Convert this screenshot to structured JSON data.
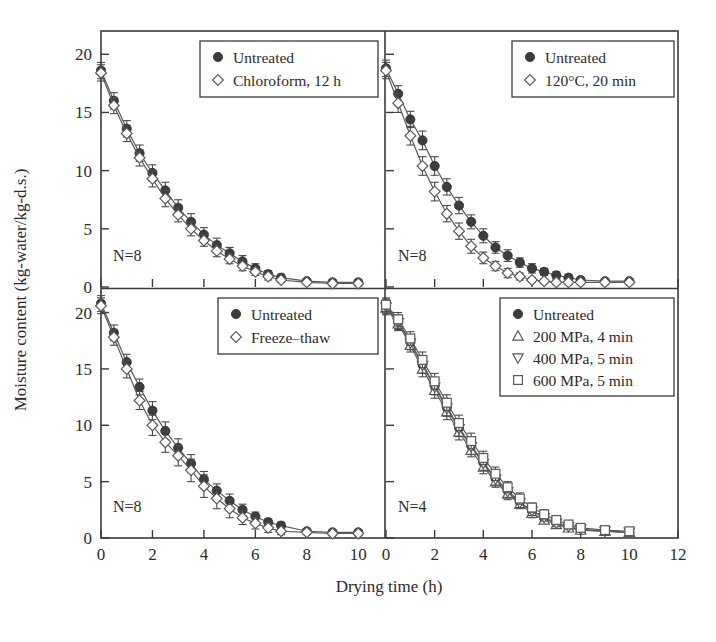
{
  "figure": {
    "xlabel": "Drying time (h)",
    "ylabel": "Moisture content (kg-water/kg-d.s.)",
    "x_ticks": [
      0,
      2,
      4,
      6,
      8,
      10,
      12
    ],
    "y_ticks": [
      0,
      5,
      10,
      15,
      20
    ],
    "xlim": [
      0,
      12
    ],
    "ylim": [
      0,
      22
    ],
    "panel_xlim_left": [
      0,
      11
    ],
    "marker_colors": {
      "filled_circle": "#3d3d3d",
      "open_marker_fill": "#ffffff",
      "line": "#5a5a5a",
      "axis": "#3a3a3a"
    }
  },
  "chart_data": {
    "type": "line",
    "title": "",
    "xlabel": "Drying time (h)",
    "ylabel": "Moisture content (kg-water/kg-d.s.)",
    "xlim": [
      0,
      12
    ],
    "ylim": [
      0,
      22
    ],
    "xticks": [
      0,
      2,
      4,
      6,
      8,
      10,
      12
    ],
    "yticks": [
      0,
      5,
      10,
      15,
      20
    ],
    "grid": false,
    "legend_position": "top-right inside each panel",
    "panels": [
      {
        "panel_id": "top-left",
        "n_label": "N=8",
        "legend": [
          {
            "label": "Untreated",
            "marker": "filled-circle"
          },
          {
            "label": "Chloroform, 12 h",
            "marker": "open-diamond"
          }
        ],
        "x": [
          0,
          0.5,
          1,
          1.5,
          2,
          2.5,
          3,
          3.5,
          4,
          4.5,
          5,
          5.5,
          6,
          6.5,
          7,
          8,
          9,
          10
        ],
        "series": [
          {
            "name": "Untreated",
            "marker": "filled-circle",
            "values": [
              18.6,
              16.0,
              13.6,
              11.5,
              9.8,
              8.3,
              6.8,
              5.6,
              4.5,
              3.6,
              2.9,
              2.2,
              1.6,
              1.1,
              0.8,
              0.5,
              0.4,
              0.4
            ],
            "errors": [
              0.7,
              0.7,
              0.7,
              0.7,
              0.7,
              0.7,
              0.7,
              0.7,
              0.6,
              0.6,
              0.5,
              0.5,
              0.4,
              0.3,
              0.3,
              0.2,
              0.2,
              0.2
            ]
          },
          {
            "name": "Chloroform, 12 h",
            "marker": "open-diamond",
            "values": [
              18.4,
              15.6,
              13.2,
              11.1,
              9.3,
              7.6,
              6.2,
              5.0,
              4.0,
              3.1,
              2.4,
              1.8,
              1.3,
              0.9,
              0.6,
              0.4,
              0.3,
              0.3
            ],
            "errors": [
              0.7,
              0.7,
              0.7,
              0.7,
              0.7,
              0.7,
              0.6,
              0.6,
              0.5,
              0.5,
              0.4,
              0.4,
              0.3,
              0.3,
              0.2,
              0.2,
              0.2,
              0.2
            ]
          }
        ]
      },
      {
        "panel_id": "top-right",
        "n_label": "N=8",
        "legend": [
          {
            "label": "Untreated",
            "marker": "filled-circle"
          },
          {
            "label": "120°C, 20 min",
            "marker": "open-diamond"
          }
        ],
        "x": [
          0,
          0.5,
          1,
          1.5,
          2,
          2.5,
          3,
          3.5,
          4,
          4.5,
          5,
          5.5,
          6,
          6.5,
          7,
          7.5,
          8,
          9,
          10
        ],
        "series": [
          {
            "name": "Untreated",
            "marker": "filled-circle",
            "values": [
              18.8,
              16.6,
              14.4,
              12.6,
              10.4,
              8.6,
              7.0,
              5.6,
              4.4,
              3.4,
              2.7,
              2.1,
              1.6,
              1.3,
              1.0,
              0.8,
              0.6,
              0.5,
              0.5
            ],
            "errors": [
              0.7,
              0.7,
              0.7,
              0.8,
              0.8,
              0.7,
              0.7,
              0.6,
              0.6,
              0.5,
              0.5,
              0.4,
              0.4,
              0.3,
              0.3,
              0.3,
              0.2,
              0.2,
              0.2
            ]
          },
          {
            "name": "120°C, 20 min",
            "marker": "open-diamond",
            "values": [
              18.6,
              15.8,
              13.0,
              10.4,
              8.2,
              6.3,
              4.8,
              3.5,
              2.5,
              1.8,
              1.2,
              0.9,
              0.6,
              0.5,
              0.4,
              0.4,
              0.4,
              0.4,
              0.4
            ],
            "errors": [
              0.7,
              0.8,
              0.8,
              0.8,
              0.8,
              0.7,
              0.7,
              0.6,
              0.5,
              0.4,
              0.4,
              0.3,
              0.2,
              0.2,
              0.2,
              0.2,
              0.2,
              0.2,
              0.2
            ]
          }
        ]
      },
      {
        "panel_id": "bottom-left",
        "n_label": "N=8",
        "legend": [
          {
            "label": "Untreated",
            "marker": "filled-circle"
          },
          {
            "label": "Freeze–thaw",
            "marker": "open-diamond"
          }
        ],
        "x": [
          0,
          0.5,
          1,
          1.5,
          2,
          2.5,
          3,
          3.5,
          4,
          4.5,
          5,
          5.5,
          6,
          6.5,
          7,
          8,
          9,
          10
        ],
        "series": [
          {
            "name": "Untreated",
            "marker": "filled-circle",
            "values": [
              20.8,
              18.2,
              15.6,
              13.4,
              11.3,
              9.5,
              8.0,
              6.6,
              5.2,
              4.2,
              3.3,
              2.5,
              1.9,
              1.4,
              1.1,
              0.6,
              0.5,
              0.5
            ],
            "errors": [
              0.7,
              0.7,
              0.7,
              0.7,
              0.8,
              0.8,
              0.8,
              0.8,
              0.7,
              0.6,
              0.6,
              0.5,
              0.4,
              0.3,
              0.3,
              0.2,
              0.2,
              0.2
            ]
          },
          {
            "name": "Freeze–thaw",
            "marker": "open-diamond",
            "values": [
              20.6,
              17.8,
              15.0,
              12.2,
              10.0,
              8.5,
              7.3,
              6.0,
              4.6,
              3.5,
              2.6,
              1.8,
              1.3,
              0.9,
              0.6,
              0.5,
              0.4,
              0.4
            ],
            "errors": [
              0.7,
              0.7,
              0.8,
              0.8,
              0.9,
              0.9,
              0.9,
              1.0,
              1.0,
              0.9,
              0.8,
              0.6,
              0.5,
              0.4,
              0.3,
              0.2,
              0.2,
              0.2
            ]
          }
        ]
      },
      {
        "panel_id": "bottom-right",
        "n_label": "N=4",
        "legend": [
          {
            "label": "Untreated",
            "marker": "filled-circle"
          },
          {
            "label": "200 MPa, 4 min",
            "marker": "open-triangle-up"
          },
          {
            "label": "400 MPa, 5 min",
            "marker": "open-triangle-down"
          },
          {
            "label": "600 MPa, 5 min",
            "marker": "open-square"
          }
        ],
        "x": [
          0,
          0.5,
          1,
          1.5,
          2,
          2.5,
          3,
          3.5,
          4,
          4.5,
          5,
          5.5,
          6,
          6.5,
          7,
          7.5,
          8,
          9,
          10
        ],
        "series": [
          {
            "name": "Untreated",
            "marker": "filled-circle",
            "values": [
              20.6,
              19.2,
              17.4,
              15.4,
              13.5,
              11.6,
              9.8,
              8.2,
              6.7,
              5.3,
              4.2,
              3.2,
              2.4,
              1.8,
              1.3,
              1.0,
              0.7,
              0.6,
              0.5
            ],
            "errors": [
              0.6,
              0.6,
              0.6,
              0.7,
              0.7,
              0.7,
              0.7,
              0.7,
              0.6,
              0.6,
              0.5,
              0.5,
              0.4,
              0.3,
              0.3,
              0.2,
              0.2,
              0.2,
              0.2
            ]
          },
          {
            "name": "200 MPa, 4 min",
            "marker": "open-triangle-up",
            "values": [
              20.4,
              19.0,
              17.1,
              15.0,
              13.1,
              11.2,
              9.4,
              7.8,
              6.3,
              5.0,
              3.9,
              3.0,
              2.2,
              1.6,
              1.2,
              0.9,
              0.7,
              0.6,
              0.5
            ],
            "errors": [
              0.6,
              0.6,
              0.6,
              0.7,
              0.7,
              0.7,
              0.7,
              0.6,
              0.6,
              0.5,
              0.5,
              0.4,
              0.4,
              0.3,
              0.3,
              0.2,
              0.2,
              0.2,
              0.2
            ]
          },
          {
            "name": "400 MPa, 5 min",
            "marker": "open-triangle-down",
            "values": [
              20.5,
              19.1,
              17.3,
              15.3,
              13.4,
              11.5,
              9.7,
              8.1,
              6.6,
              5.2,
              4.1,
              3.1,
              2.4,
              1.8,
              1.3,
              1.0,
              0.8,
              0.6,
              0.5
            ],
            "errors": [
              0.6,
              0.6,
              0.6,
              0.7,
              0.7,
              0.7,
              0.7,
              0.7,
              0.6,
              0.5,
              0.5,
              0.4,
              0.4,
              0.3,
              0.3,
              0.2,
              0.2,
              0.2,
              0.2
            ]
          },
          {
            "name": "600 MPa, 5 min",
            "marker": "open-square",
            "values": [
              20.7,
              19.4,
              17.7,
              15.8,
              13.9,
              12.0,
              10.2,
              8.6,
              7.1,
              5.7,
              4.5,
              3.5,
              2.7,
              2.1,
              1.6,
              1.2,
              0.9,
              0.7,
              0.6
            ],
            "errors": [
              0.6,
              0.6,
              0.6,
              0.7,
              0.7,
              0.7,
              0.7,
              0.7,
              0.6,
              0.6,
              0.5,
              0.5,
              0.4,
              0.4,
              0.3,
              0.3,
              0.2,
              0.2,
              0.2
            ]
          }
        ]
      }
    ]
  }
}
